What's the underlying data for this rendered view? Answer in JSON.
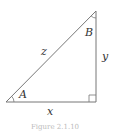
{
  "figure": {
    "type": "right-triangle",
    "labels": {
      "hypotenuse": "z",
      "adjacent": "x",
      "opposite": "y",
      "angle_bottom_left": "A",
      "angle_top": "B"
    },
    "caption": "Figure 2.1.10",
    "colors": {
      "stroke": "#777777",
      "text": "#333333"
    }
  }
}
